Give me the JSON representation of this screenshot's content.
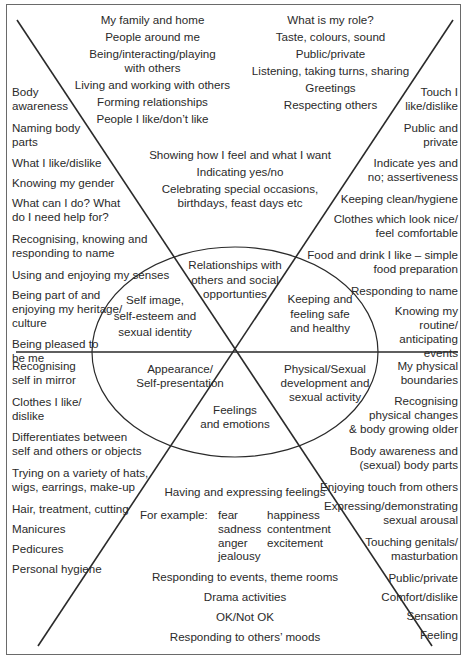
{
  "diagram": {
    "type": "sector-diagram",
    "colors": {
      "line": "#2a2a2a",
      "border": "#6a6a6a",
      "text": "#2a2a2a",
      "background": "#ffffff"
    },
    "center_labels": {
      "top": "Relationships with\nothers and social\nopportunties",
      "upper_left": "Self image,\nself-esteem and\nsexual identity",
      "upper_right": "Keeping and\nfeeling safe\nand healthy",
      "lower_left": "Appearance/\nSelf-presentation",
      "lower_right": "Physical/Sexual\ndevelopment and\nsexual activity",
      "bottom": "Feelings\nand emotions"
    },
    "sections": {
      "top_left": [
        "My family and home",
        "People around me",
        "Being/interacting/playing\nwith others",
        "Living and working with others",
        "Forming relationships",
        "People I like/don’t like"
      ],
      "top_right": [
        "What is my role?",
        "Taste, colours, sound",
        "Public/private",
        "Listening, taking turns, sharing",
        "Greetings",
        "Respecting others"
      ],
      "top_center": [
        "Showing how I feel and what I want",
        "Indicating yes/no",
        "Celebrating special occasions,\nbirthdays, feast days etc"
      ],
      "left": [
        "Body\nawareness",
        "Naming body\nparts",
        "What I like/dislike",
        "Knowing my gender",
        "What can I do? What\ndo I need help for?",
        "Recognising, knowing and\nresponding to name",
        "Using and enjoying my senses",
        "Being part of and\nenjoying my heritage/\nculture",
        "Being pleased to\nbe me"
      ],
      "right": [
        "Touch I\nlike/dislike",
        "Public and\nprivate",
        "Indicate yes and\nno; assertiveness",
        "Keeping clean/hygiene",
        "Clothes which look nice/\nfeel comfortable",
        "Food and drink I like – simple\nfood preparation",
        "Responding to name",
        "Knowing my\nroutine/\nanticipating\nevents"
      ],
      "lower_left": [
        "Recognising\nself in mirror",
        "Clothes I like/\ndislike",
        "Differentiates between\nself and others or objects",
        "Trying on a variety of hats,\nwigs, earrings, make-up",
        "Hair, treatment, cutting",
        "Manicures",
        "Pedicures",
        "Personal hygiene"
      ],
      "lower_right": [
        "My physical\nboundaries",
        "Recognising\nphysical changes\n& body growing older",
        "Body awareness and\n(sexual) body parts",
        "Enjoying touch from others",
        "Expressing/demonstrating\nsexual arousal",
        "Touching genitals/\nmasturbation",
        "Public/private",
        "Comfort/dislike",
        "Sensation",
        "Feeling"
      ],
      "bottom": {
        "heading": "Having and expressing feelings",
        "example_label": "For example:",
        "examples_col1": [
          "fear",
          "sadness",
          "anger",
          "jealousy"
        ],
        "examples_col2": [
          "happiness",
          "contentment",
          "excitement"
        ],
        "items": [
          "Responding to events, theme rooms",
          "Drama activities",
          "OK/Not OK",
          "Responding to others’ moods"
        ]
      }
    }
  }
}
